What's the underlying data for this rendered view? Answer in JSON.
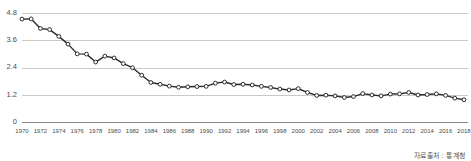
{
  "source_note": "자료출처 : 통계청",
  "chart_data": {
    "type": "line",
    "title": "",
    "subtitle": "",
    "xlabel": "",
    "ylabel": "",
    "grid": true,
    "legend": "none",
    "marker": "open-circle",
    "line_color": "#2b2b2b",
    "marker_fill": "#ffffff",
    "gridline_color": "#c9c9c9",
    "axis_color": "#8a8a8a",
    "xlim": [
      1970,
      2018
    ],
    "ylim": [
      0,
      4.8
    ],
    "yticks": [
      0,
      1.2,
      2.4,
      3.6,
      4.8
    ],
    "ytick_labels": [
      "0",
      "1.2",
      "2.4",
      "3.6",
      "4.8"
    ],
    "xticks": [
      1970,
      1972,
      1974,
      1976,
      1978,
      1980,
      1982,
      1984,
      1986,
      1988,
      1990,
      1992,
      1994,
      1996,
      1998,
      2000,
      2002,
      2004,
      2006,
      2008,
      2010,
      2012,
      2014,
      2016,
      2018
    ],
    "xtick_labels": [
      "1970",
      "1972",
      "1974",
      "1976",
      "1978",
      "1980",
      "1982",
      "1984",
      "1986",
      "1988",
      "1990",
      "1992",
      "1994",
      "1996",
      "1998",
      "2000",
      "2002",
      "2004",
      "2006",
      "2008",
      "2010",
      "2012",
      "2014",
      "2016",
      "2018"
    ],
    "x": [
      1970,
      1971,
      1972,
      1973,
      1974,
      1975,
      1976,
      1977,
      1978,
      1979,
      1980,
      1981,
      1982,
      1983,
      1984,
      1985,
      1986,
      1987,
      1988,
      1989,
      1990,
      1991,
      1992,
      1993,
      1994,
      1995,
      1996,
      1997,
      1998,
      1999,
      2000,
      2001,
      2002,
      2003,
      2004,
      2005,
      2006,
      2007,
      2008,
      2009,
      2010,
      2011,
      2012,
      2013,
      2014,
      2015,
      2016,
      2017,
      2018
    ],
    "series": [
      {
        "name": "합계출산율",
        "values": [
          4.53,
          4.54,
          4.12,
          4.07,
          3.77,
          3.43,
          3.0,
          2.99,
          2.64,
          2.9,
          2.82,
          2.57,
          2.39,
          2.06,
          1.74,
          1.66,
          1.58,
          1.53,
          1.55,
          1.56,
          1.57,
          1.71,
          1.76,
          1.65,
          1.66,
          1.63,
          1.57,
          1.52,
          1.45,
          1.41,
          1.47,
          1.3,
          1.17,
          1.18,
          1.15,
          1.08,
          1.12,
          1.25,
          1.19,
          1.15,
          1.23,
          1.24,
          1.3,
          1.19,
          1.21,
          1.24,
          1.17,
          1.05,
          0.98
        ]
      }
    ]
  }
}
